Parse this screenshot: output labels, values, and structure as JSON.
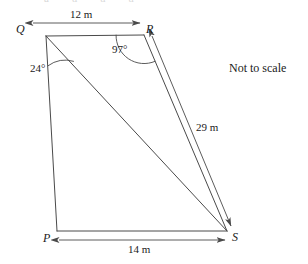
{
  "figure": {
    "note": "Not to scale",
    "top_cropped_text": "a u u u",
    "background_color": "#ffffff",
    "line_color": "#4a4a4a",
    "text_color": "#1a1a1a"
  },
  "vertices": [
    {
      "id": "Q",
      "label": "Q",
      "x": 30,
      "y": 30,
      "point_x": 46,
      "point_y": 36,
      "label_x": 18,
      "label_y": 24
    },
    {
      "id": "R",
      "label": "R",
      "x": 148,
      "y": 30,
      "point_x": 144,
      "point_y": 35,
      "label_x": 146,
      "label_y": 24
    },
    {
      "id": "P",
      "label": "P",
      "x": 48,
      "y": 236,
      "point_x": 57,
      "point_y": 231,
      "label_x": 44,
      "label_y": 233
    },
    {
      "id": "S",
      "label": "S",
      "x": 232,
      "y": 236,
      "point_x": 227,
      "point_y": 231,
      "label_x": 232,
      "label_y": 233
    }
  ],
  "sides": [
    {
      "name": "QR",
      "from": "Q",
      "to": "R"
    },
    {
      "name": "RS",
      "from": "R",
      "to": "S"
    },
    {
      "name": "SP",
      "from": "S",
      "to": "P"
    },
    {
      "name": "PQ",
      "from": "P",
      "to": "Q"
    }
  ],
  "diagonals": [
    {
      "name": "QS",
      "from": "Q",
      "to": "S"
    }
  ],
  "dimensions": [
    {
      "name": "QR-length",
      "label": "12 m",
      "value": 12,
      "unit": "m",
      "label_x": 71,
      "label_y": 12,
      "arrow_x1": 33,
      "arrow_y1": 23,
      "arrow_x2": 140,
      "arrow_y2": 23,
      "double_headed": true
    },
    {
      "name": "RS-length",
      "label": "29 m",
      "value": 29,
      "unit": "m",
      "label_x": 196,
      "label_y": 123,
      "arrow_x1": 152,
      "arrow_y1": 36,
      "arrow_x2": 231,
      "arrow_y2": 228,
      "double_headed": true
    },
    {
      "name": "PS-length",
      "label": "14 m",
      "value": 14,
      "unit": "m",
      "label_x": 129,
      "label_y": 244,
      "arrow_x1": 59,
      "arrow_y1": 240,
      "arrow_x2": 225,
      "arrow_y2": 240,
      "double_headed": true
    }
  ],
  "angles": [
    {
      "name": "angle-at-Q",
      "label": "24°",
      "value": 24,
      "at_vertex": "Q",
      "between": [
        "QP",
        "QS"
      ],
      "label_x": 30,
      "label_y": 63,
      "arc_radius": 30
    },
    {
      "name": "angle-at-R",
      "label": "97°",
      "value": 97,
      "at_vertex": "R",
      "between": [
        "RQ",
        "RS"
      ],
      "label_x": 113,
      "label_y": 44,
      "arc_radius": 28
    }
  ],
  "annotations": [
    {
      "name": "not-to-scale-note",
      "text": "Not to scale",
      "x": 229,
      "y": 62
    }
  ]
}
